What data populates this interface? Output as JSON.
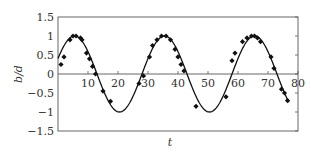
{
  "chart_data": {
    "type": "line",
    "title": "",
    "xlabel": "t",
    "ylabel": "b/d",
    "xlim": [
      0,
      80
    ],
    "ylim": [
      -1.5,
      1.5
    ],
    "xticks": [
      10,
      20,
      30,
      40,
      50,
      60,
      70,
      80
    ],
    "yticks": [
      1.5,
      1,
      0.5,
      0,
      -0.5,
      -1,
      -1.5
    ],
    "ytick_labels": [
      "1.5",
      "1",
      "0.5",
      "0",
      "−0.5",
      "−1",
      "−1.5"
    ],
    "grid": false,
    "legend": null,
    "series": [
      {
        "name": "fit",
        "style": "solid-line",
        "color": "#111111",
        "function": "cos(2*pi*(t-5.5)/30)",
        "t_range": [
          0,
          77
        ]
      },
      {
        "name": "measured",
        "style": "diamond-markers",
        "color": "#111111",
        "points": [
          [
            1,
            0.25
          ],
          [
            2,
            0.45
          ],
          [
            4,
            0.9
          ],
          [
            5,
            1.0
          ],
          [
            6,
            1.0
          ],
          [
            7.5,
            0.95
          ],
          [
            8,
            0.9
          ],
          [
            9.5,
            0.55
          ],
          [
            10.5,
            0.4
          ],
          [
            11.5,
            0.2
          ],
          [
            12.5,
            0.0
          ],
          [
            15,
            -0.45
          ],
          [
            17.5,
            -0.72
          ],
          [
            27,
            -0.25
          ],
          [
            28.5,
            -0.05
          ],
          [
            30.5,
            0.45
          ],
          [
            31.5,
            0.75
          ],
          [
            33,
            0.9
          ],
          [
            34.5,
            1.0
          ],
          [
            36,
            1.0
          ],
          [
            37.5,
            0.9
          ],
          [
            39,
            0.65
          ],
          [
            40,
            0.45
          ],
          [
            41,
            0.25
          ],
          [
            42,
            0.08
          ],
          [
            46,
            -0.85
          ],
          [
            56,
            -0.6
          ],
          [
            58,
            0.35
          ],
          [
            59,
            0.55
          ],
          [
            61.5,
            0.85
          ],
          [
            63,
            0.95
          ],
          [
            64.5,
            1.0
          ],
          [
            65.5,
            1.0
          ],
          [
            66.5,
            0.95
          ],
          [
            67.5,
            0.85
          ],
          [
            71,
            0.45
          ],
          [
            72,
            0.15
          ],
          [
            74.5,
            -0.4
          ],
          [
            75.5,
            -0.5
          ],
          [
            76.5,
            -0.7
          ]
        ]
      }
    ]
  }
}
